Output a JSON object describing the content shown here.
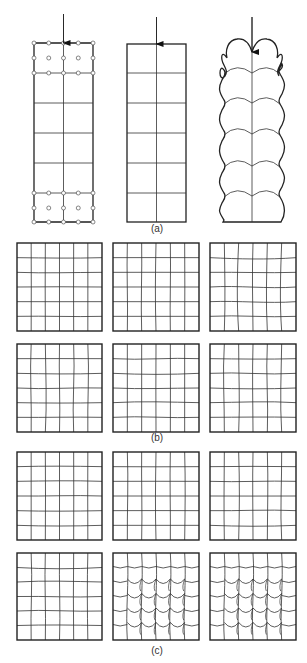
{
  "figure": {
    "width": 307,
    "height": 663,
    "stroke_color": "#222222",
    "grid_color": "#333333",
    "node_fill": "#ffffff",
    "panel_labels": [
      {
        "id": "a",
        "text": "(a)",
        "x": 157,
        "y": 232
      },
      {
        "id": "b",
        "text": "(b)",
        "x": 157,
        "y": 441
      },
      {
        "id": "c",
        "text": "(c)",
        "x": 157,
        "y": 654
      }
    ]
  },
  "section_a": {
    "columns": [
      {
        "name": "column-meshed",
        "x0": 34,
        "x1": 93,
        "top": 43,
        "bottom": 222,
        "arrow_top": 14,
        "rows": [
          43,
          58,
          73,
          103,
          133,
          163,
          193,
          208,
          222
        ],
        "nodes": true
      },
      {
        "name": "column-initial",
        "x0": 127,
        "x1": 186,
        "top": 44,
        "bottom": 222,
        "arrow_top": 17,
        "rows": [
          73,
          103,
          133,
          163,
          193
        ],
        "nodes": false
      },
      {
        "name": "column-deformed",
        "x0": 221,
        "x1": 283,
        "top": 40,
        "bottom": 222,
        "arrow_top": 17,
        "rows": [
          70,
          100,
          131,
          163,
          193
        ],
        "nodes": false
      }
    ]
  },
  "grids": {
    "divisions": 6,
    "boxes": [
      {
        "name": "grid-b-1",
        "x": 17,
        "y": 243,
        "w": 85,
        "h": 88,
        "style": "wavy-h",
        "amp": 1.2
      },
      {
        "name": "grid-b-2",
        "x": 113,
        "y": 243,
        "w": 86,
        "h": 88,
        "style": "wavy-v",
        "amp": 1.2
      },
      {
        "name": "grid-b-3",
        "x": 210,
        "y": 243,
        "w": 86,
        "h": 88,
        "style": "wavy-both",
        "amp": 2.2
      },
      {
        "name": "grid-b-4",
        "x": 17,
        "y": 344,
        "w": 85,
        "h": 88,
        "style": "wavy-both",
        "amp": 1.8
      },
      {
        "name": "grid-b-5",
        "x": 113,
        "y": 344,
        "w": 86,
        "h": 88,
        "style": "wavy-h",
        "amp": 1.8
      },
      {
        "name": "grid-b-6",
        "x": 210,
        "y": 344,
        "w": 86,
        "h": 88,
        "style": "wavy-both",
        "amp": 2.0
      },
      {
        "name": "grid-c-1",
        "x": 17,
        "y": 452,
        "w": 85,
        "h": 88,
        "style": "wavy-h",
        "amp": 1.2
      },
      {
        "name": "grid-c-2",
        "x": 113,
        "y": 452,
        "w": 86,
        "h": 88,
        "style": "wavy-v",
        "amp": 1.3
      },
      {
        "name": "grid-c-3",
        "x": 210,
        "y": 452,
        "w": 86,
        "h": 88,
        "style": "wavy-both",
        "amp": 1.8
      },
      {
        "name": "grid-c-4",
        "x": 17,
        "y": 553,
        "w": 85,
        "h": 87,
        "style": "wavy-both",
        "amp": 1.8
      },
      {
        "name": "grid-c-5",
        "x": 113,
        "y": 553,
        "w": 86,
        "h": 87,
        "style": "scales",
        "amp": 0
      },
      {
        "name": "grid-c-6",
        "x": 210,
        "y": 553,
        "w": 86,
        "h": 87,
        "style": "scales",
        "amp": 0
      }
    ]
  }
}
